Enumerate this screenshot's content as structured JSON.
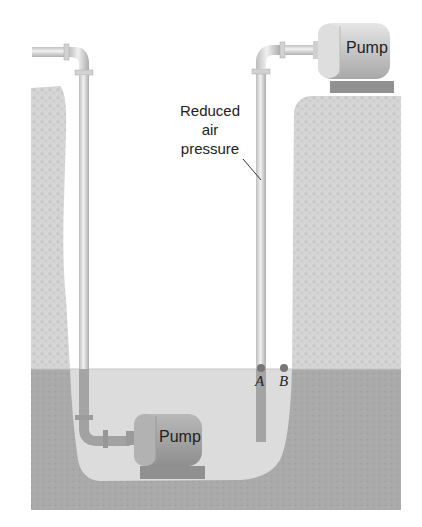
{
  "diagram": {
    "labels": {
      "callout": [
        "Reduced",
        "air",
        "pressure"
      ],
      "pump_top": "Pump",
      "pump_bottom": "Pump",
      "point_a": "A",
      "point_b": "B"
    },
    "colors": {
      "background": "#ffffff",
      "dry_soil": "#d4d4d4",
      "wet_soil": "#a9a9a9",
      "water": "#dcdcdc",
      "pipe_light": "#d8d8d8",
      "pipe_submerged": "#a2a2a2",
      "pump_body": "#c8c8c8",
      "pump_base": "#8e8e8e",
      "point_marker": "#7a7a7a"
    }
  }
}
